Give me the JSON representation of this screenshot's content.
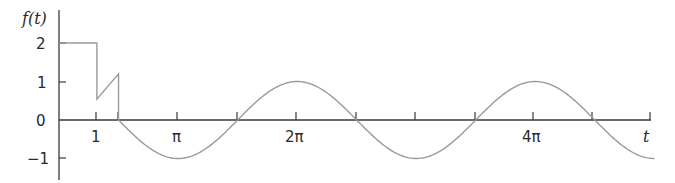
{
  "chart_data": {
    "type": "line",
    "title": "",
    "xlabel": "t",
    "ylabel": "f(t)",
    "xlim": [
      0,
      15.71
    ],
    "ylim": [
      -1.5,
      2.8
    ],
    "grid": false,
    "legend": null,
    "x_ticks": [
      {
        "value": 1,
        "label": "1"
      },
      {
        "value": 1.5708,
        "label": ""
      },
      {
        "value": 3.1416,
        "label": "π"
      },
      {
        "value": 4.7124,
        "label": ""
      },
      {
        "value": 6.2832,
        "label": "2π"
      },
      {
        "value": 7.854,
        "label": ""
      },
      {
        "value": 9.4248,
        "label": ""
      },
      {
        "value": 10.9956,
        "label": ""
      },
      {
        "value": 12.5664,
        "label": "4π"
      },
      {
        "value": 14.1372,
        "label": ""
      },
      {
        "value": 15.708,
        "label": ""
      }
    ],
    "y_ticks": [
      {
        "value": 2,
        "label": "2"
      },
      {
        "value": 1,
        "label": "1"
      },
      {
        "value": 0,
        "label": "0"
      },
      {
        "value": -1,
        "label": "-1"
      }
    ],
    "series": [
      {
        "name": "f(t)",
        "pieces": [
          {
            "domain": [
              0,
              1
            ],
            "expr": "2",
            "description": "constant 2"
          },
          {
            "domain": [
              1,
              1.5708
            ],
            "expr": "linear ramp",
            "points": [
              [
                1,
                0.54
              ],
              [
                1.5708,
                1.2
              ]
            ],
            "description": "jump down at t=1, ramp up"
          },
          {
            "domain": [
              1.5708,
              15.708
            ],
            "expr": "cos(t)",
            "description": "cosine after drop to 0 at t=π/2"
          }
        ],
        "key_points": [
          {
            "t": 0,
            "f": 2
          },
          {
            "t": 1,
            "f": 2
          },
          {
            "t": 1,
            "f": 0.54
          },
          {
            "t": 1.5708,
            "f": 1.2
          },
          {
            "t": 1.5708,
            "f": 0
          },
          {
            "t": 3.1416,
            "f": -1
          },
          {
            "t": 6.2832,
            "f": 1
          },
          {
            "t": 9.4248,
            "f": -1
          },
          {
            "t": 12.5664,
            "f": 1
          },
          {
            "t": 15.708,
            "f": -1
          }
        ]
      }
    ]
  },
  "labels": {
    "y_axis_title": "f(t)",
    "x_axis_title": "t",
    "y_tick_2": "2",
    "y_tick_1": "1",
    "y_tick_0": "0",
    "y_tick_m1": "−1",
    "x_tick_1": "1",
    "x_tick_pi": "π",
    "x_tick_2pi": "2π",
    "x_tick_4pi": "4π"
  },
  "colors": {
    "axis": "#3a3a3a",
    "curve": "#9a9a9a",
    "text": "#2a2a2a",
    "background": "#ffffff"
  }
}
